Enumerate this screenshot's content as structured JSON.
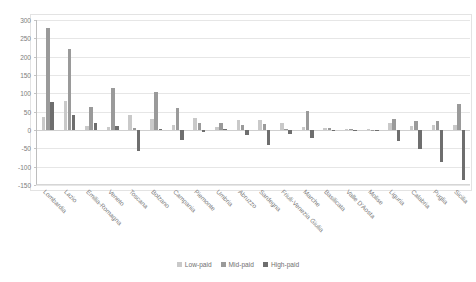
{
  "chart_data": {
    "type": "bar",
    "title": "",
    "subtitle": "",
    "xlabel": "",
    "ylabel": "",
    "ylim": [
      -150,
      300
    ],
    "ytick_step": 50,
    "yticks": [
      300,
      250,
      200,
      150,
      100,
      50,
      0,
      -50,
      -100,
      -150
    ],
    "grid": true,
    "grid_axis": "y",
    "legend_position": "bottom-center",
    "orientation": "vertical",
    "bar_mode": "grouped",
    "categories": [
      "Lombardia",
      "Lazio",
      "Emilia-Romagna",
      "Veneto",
      "Toscana",
      "Bolzano",
      "Campania",
      "Piemonte",
      "Umbria",
      "Abruzzo",
      "Sardegna",
      "Friuli-Venezia Giulia",
      "Marche",
      "Basilicata",
      "Valle D'Aosta",
      "Molise",
      "Liguria",
      "Calabria",
      "Puglia",
      "Sicilia"
    ],
    "series": [
      {
        "name": "Low-paid",
        "color": "#c9c9c9",
        "values": [
          36,
          78,
          11,
          8,
          42,
          30,
          15,
          33,
          9,
          28,
          26,
          20,
          9,
          5,
          3,
          2,
          20,
          12,
          14,
          13
        ]
      },
      {
        "name": "Mid-paid",
        "color": "#9a9a9a",
        "values": [
          277,
          221,
          63,
          114,
          6,
          103,
          60,
          18,
          20,
          15,
          17,
          4,
          53,
          6,
          2,
          1,
          30,
          25,
          24,
          70
        ]
      },
      {
        "name": "High-paid",
        "color": "#6e6e6e",
        "values": [
          76,
          40,
          19,
          11,
          -57,
          4,
          -26,
          -6,
          3,
          -14,
          -42,
          -12,
          -22,
          -3,
          -2,
          -1,
          -31,
          -52,
          -88,
          -135
        ]
      }
    ]
  },
  "legend": {
    "items": [
      {
        "label": "Low-paid",
        "color": "#c9c9c9"
      },
      {
        "label": "Mid-paid",
        "color": "#9a9a9a"
      },
      {
        "label": "High-paid",
        "color": "#6e6e6e"
      }
    ]
  }
}
